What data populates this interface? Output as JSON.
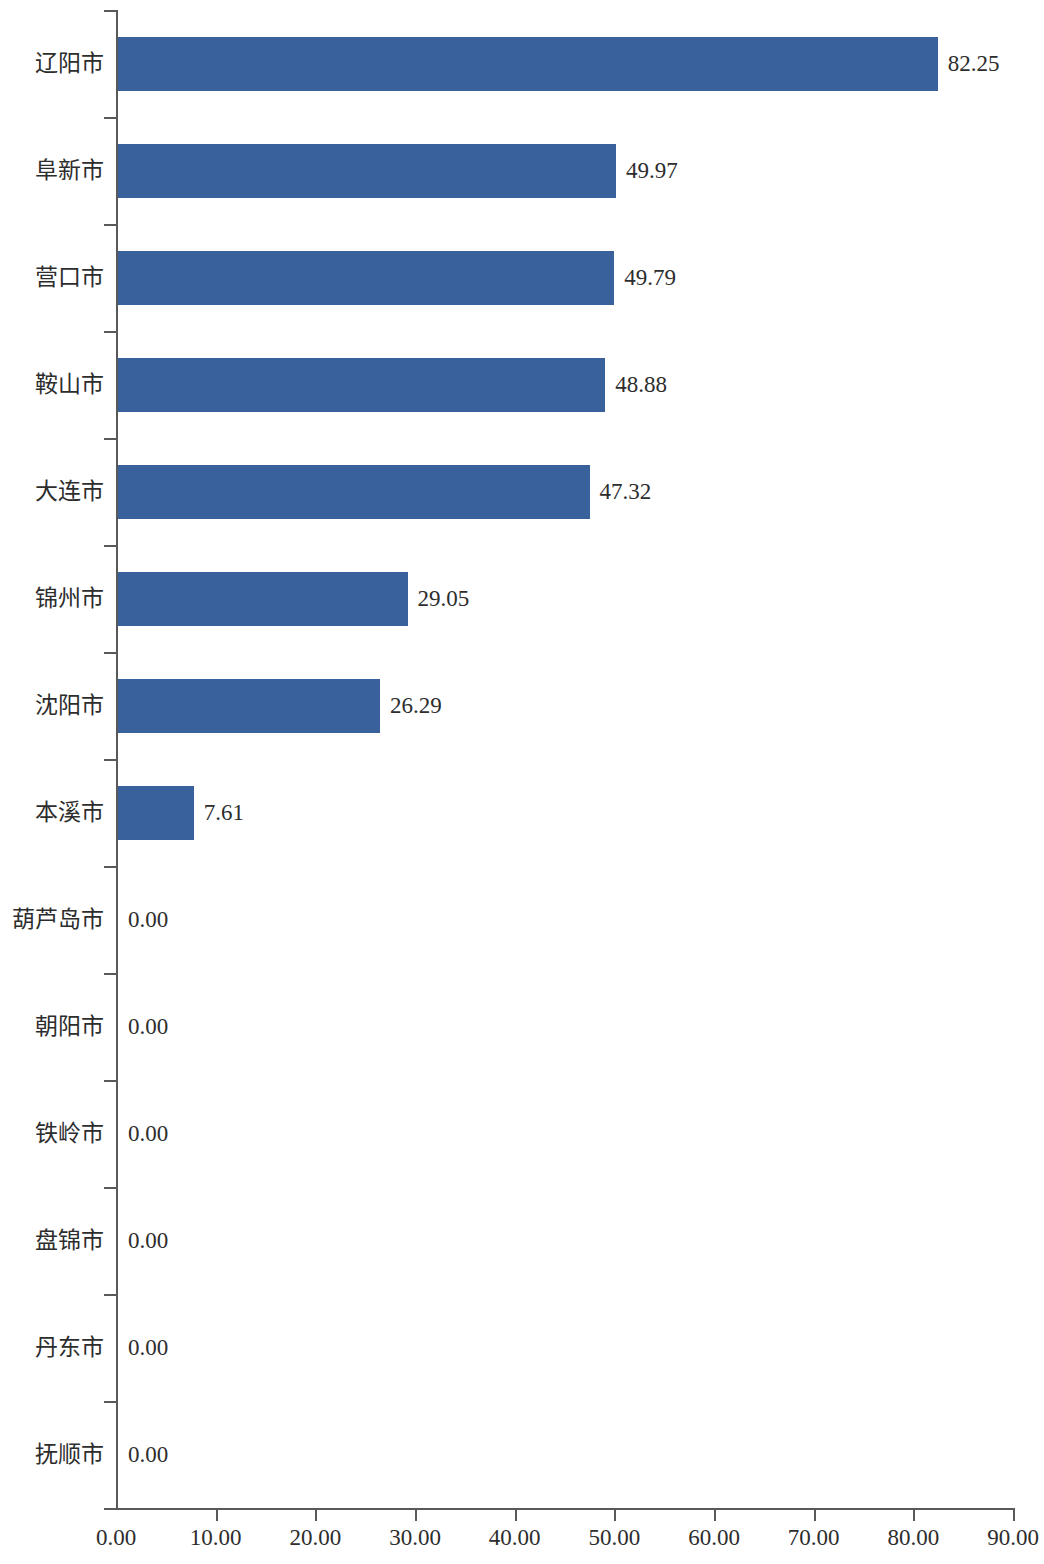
{
  "chart_data": {
    "type": "bar",
    "orientation": "horizontal",
    "title": "",
    "subtitle": "",
    "xlabel": "",
    "ylabel": "",
    "grid": false,
    "legend": false,
    "xlim": [
      0,
      90
    ],
    "xticks": [
      "0.00",
      "10.00",
      "20.00",
      "30.00",
      "40.00",
      "50.00",
      "60.00",
      "70.00",
      "80.00",
      "90.00"
    ],
    "xtick_values": [
      0,
      10,
      20,
      30,
      40,
      50,
      60,
      70,
      80,
      90
    ],
    "categories": [
      "辽阳市",
      "阜新市",
      "营口市",
      "鞍山市",
      "大连市",
      "锦州市",
      "沈阳市",
      "本溪市",
      "葫芦岛市",
      "朝阳市",
      "铁岭市",
      "盘锦市",
      "丹东市",
      "抚顺市"
    ],
    "values": [
      82.25,
      49.97,
      49.79,
      48.88,
      47.32,
      29.05,
      26.29,
      7.61,
      0.0,
      0.0,
      0.0,
      0.0,
      0.0,
      0.0
    ],
    "data_labels": [
      "82.25",
      "49.97",
      "49.79",
      "48.88",
      "47.32",
      "29.05",
      "26.29",
      "7.61",
      "0.00",
      "0.00",
      "0.00",
      "0.00",
      "0.00",
      "0.00"
    ],
    "bar_color": "#39629c",
    "axis_color": "#595959",
    "text_color": "#2d2d2d",
    "background": "#ffffff"
  }
}
